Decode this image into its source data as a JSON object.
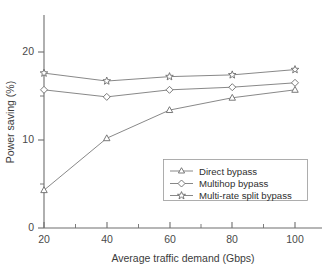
{
  "chart_data": {
    "type": "line",
    "title": "",
    "xlabel": "Average traffic demand (Gbps)",
    "ylabel": "Power saving (%)",
    "x": [
      20,
      40,
      60,
      80,
      100
    ],
    "xtick_labels": [
      "20",
      "40",
      "60",
      "80",
      "100"
    ],
    "ytick_labels": [
      "0",
      "10",
      "20"
    ],
    "yticks": [
      0,
      10,
      20
    ],
    "xlim": [
      20,
      107
    ],
    "ylim": [
      0,
      24
    ],
    "grid": false,
    "legend_position": "lower right",
    "series": [
      {
        "name": "Direct bypass",
        "marker": "triangle",
        "values": [
          4.3,
          10.2,
          13.4,
          14.8,
          15.7
        ]
      },
      {
        "name": "Multihop bypass",
        "marker": "diamond",
        "values": [
          15.7,
          14.9,
          15.7,
          16.0,
          16.5
        ]
      },
      {
        "name": "Multi-rate split bypass",
        "marker": "star",
        "values": [
          17.6,
          16.7,
          17.2,
          17.4,
          18.0
        ]
      }
    ]
  },
  "legend": {
    "entries": [
      {
        "label": "Direct bypass"
      },
      {
        "label": "Multihop bypass"
      },
      {
        "label": "Multi-rate split bypass"
      }
    ]
  },
  "colors": {
    "line": "#7a7a7a",
    "axis": "#6e6e6e",
    "marker_fill": "#ffffff",
    "marker_stroke": "#6b6b6b",
    "text": "#3a3a3a",
    "background": "#ffffff"
  }
}
